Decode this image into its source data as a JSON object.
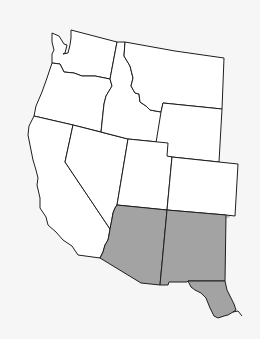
{
  "map": {
    "title": "",
    "region": "Western United States",
    "background_color": "#f6f6f6",
    "state_fill": "#ffffff",
    "highlight_fill": "#a3a3a3",
    "stroke_color": "#1e1e1e",
    "states": [
      {
        "id": "washington",
        "highlighted": false
      },
      {
        "id": "oregon",
        "highlighted": false
      },
      {
        "id": "california",
        "highlighted": false
      },
      {
        "id": "idaho",
        "highlighted": false
      },
      {
        "id": "nevada",
        "highlighted": false
      },
      {
        "id": "montana",
        "highlighted": false
      },
      {
        "id": "wyoming",
        "highlighted": false
      },
      {
        "id": "utah",
        "highlighted": false
      },
      {
        "id": "colorado",
        "highlighted": false
      },
      {
        "id": "arizona",
        "highlighted": true
      },
      {
        "id": "new-mexico",
        "highlighted": true
      },
      {
        "id": "west-texas",
        "highlighted": true
      }
    ]
  }
}
